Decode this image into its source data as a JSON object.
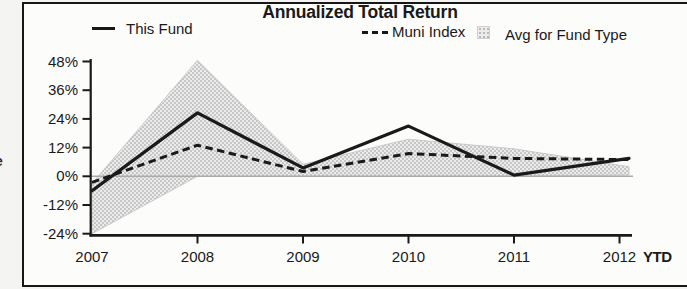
{
  "chart": {
    "title": "Annualized Total Return",
    "legend": [
      {
        "label": "This Fund",
        "swatch": "solid-line"
      },
      {
        "label": "Muni Index",
        "swatch": "dashed-line"
      },
      {
        "label": "Avg for Fund Type",
        "swatch": "shaded-band"
      }
    ],
    "y_axis": {
      "tick_labels": [
        "48%",
        "36%",
        "24%",
        "12%",
        "0%",
        "-12%",
        "-24%"
      ]
    },
    "x_axis": {
      "tick_labels": [
        "2007",
        "2008",
        "2009",
        "2010",
        "2011",
        "2012"
      ],
      "suffix_label": "YTD"
    }
  },
  "chart_data": {
    "type": "line",
    "title": "Annualized Total Return",
    "categories": [
      "2007",
      "2008",
      "2009",
      "2010",
      "2011",
      "2012"
    ],
    "x_note": "last category is 2012 YTD",
    "ylim": [
      -24,
      48
    ],
    "ytick_step": 12,
    "ytick_labels": [
      "48%",
      "36%",
      "24%",
      "12%",
      "0%",
      "-12%",
      "-24%"
    ],
    "grid": "single horizontal gray line at 0% only",
    "legend_position": "top",
    "series": [
      {
        "name": "This Fund",
        "type": "line",
        "style": "solid",
        "color": "#1a1a1a",
        "values": [
          -6,
          26.5,
          3.5,
          21,
          0.5,
          7.5
        ]
      },
      {
        "name": "Muni Index",
        "type": "line",
        "style": "dashed",
        "color": "#1a1a1a",
        "values": [
          -2.5,
          13,
          2,
          9.5,
          7.5,
          7
        ]
      },
      {
        "name": "Avg for Fund Type",
        "type": "band",
        "color": "#dcdcdc",
        "upper": [
          -3,
          48.5,
          5,
          15.5,
          11.5,
          4
        ],
        "lower": [
          -24,
          0,
          0,
          0,
          0,
          0.5
        ]
      }
    ]
  },
  "colors": {
    "ink": "#1a1a1a",
    "band_fill": "#ececec",
    "band_dots": "#b9b9b9",
    "zero_line": "#ababab",
    "paper": "#fcfcfb"
  },
  "fragment": {
    "clipped_letter": "e"
  }
}
